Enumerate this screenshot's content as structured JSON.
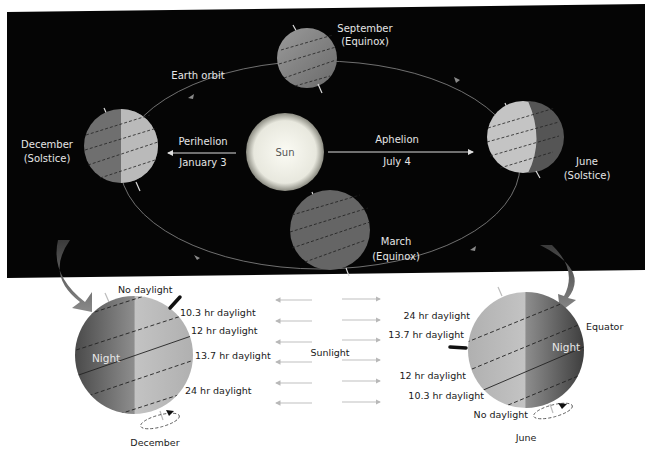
{
  "orbit_panel": {
    "background": "#050505",
    "orbit_label": "Earth orbit",
    "sun_label": "Sun",
    "perihelion": {
      "label": "Perihelion",
      "date": "January 3"
    },
    "aphelion": {
      "label": "Aphelion",
      "date": "July 4"
    },
    "positions": [
      {
        "month": "September",
        "event": "(Equinox)"
      },
      {
        "month": "December",
        "event": "(Solstice)"
      },
      {
        "month": "June",
        "event": "(Solstice)"
      },
      {
        "month": "March",
        "event": "(Equinox)"
      }
    ]
  },
  "december_detail": {
    "caption": "December",
    "night_label": "Night",
    "latitude_labels": [
      "No daylight",
      "10.3 hr daylight",
      "12 hr daylight",
      "13.7 hr daylight",
      "24 hr daylight"
    ]
  },
  "june_detail": {
    "caption": "June",
    "night_label": "Night",
    "equator_label": "Equator",
    "latitude_labels": [
      "24 hr daylight",
      "13.7 hr daylight",
      "12 hr daylight",
      "10.3 hr daylight",
      "No daylight"
    ]
  },
  "sunlight_label": "Sunlight",
  "colors": {
    "panel": "#050505",
    "sun": "#efefe6",
    "globe_day": "#bdbdbd",
    "globe_night": "#5a5a5a",
    "arrows": "#b8b8b8",
    "curved_arrows": "#7a7a7a"
  }
}
